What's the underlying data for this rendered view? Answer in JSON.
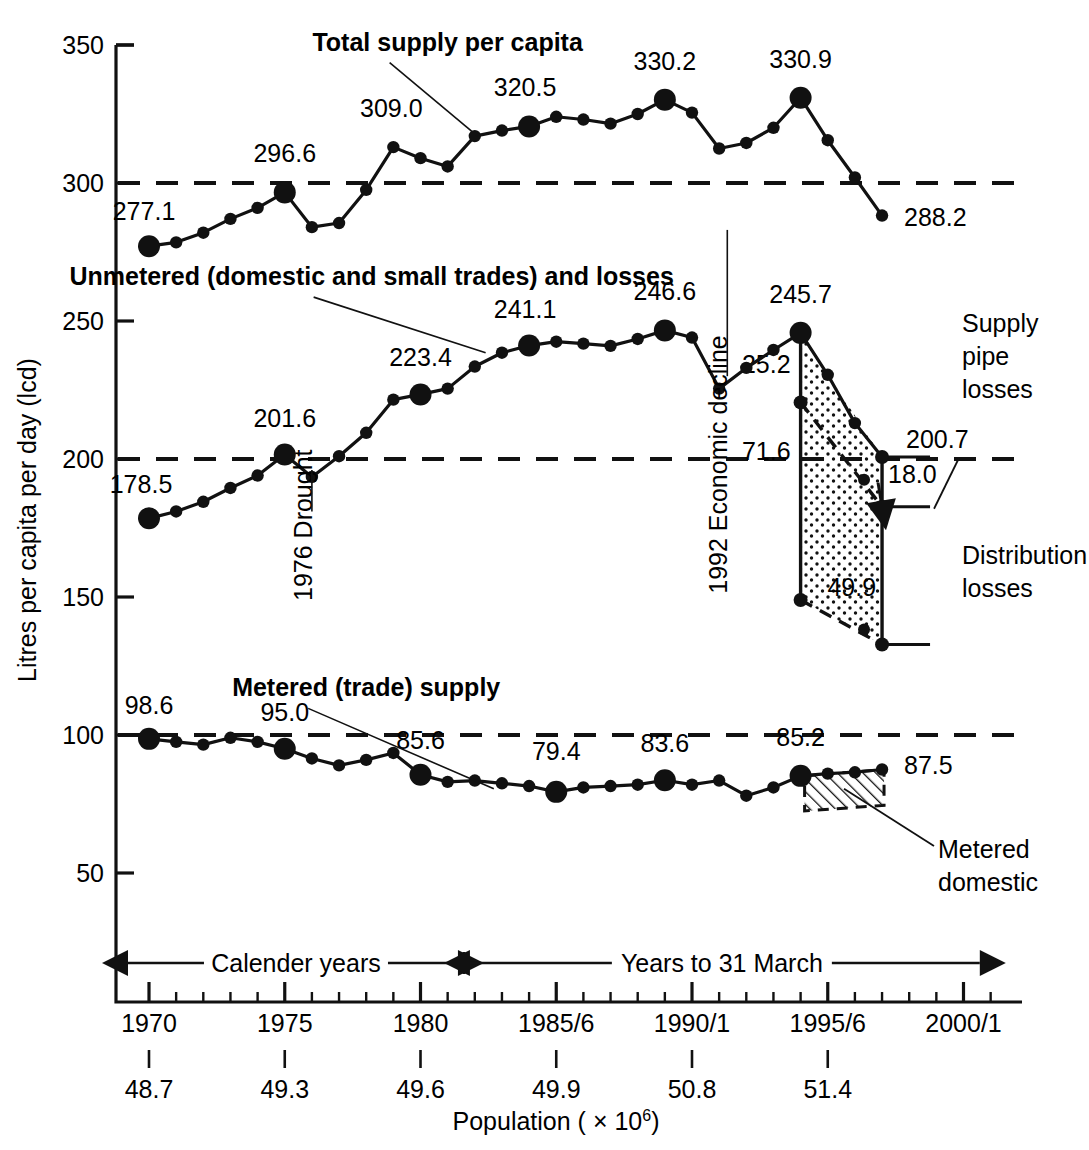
{
  "chart_data": {
    "type": "line",
    "title": "",
    "ylabel": "Litres per capita per day (lcd)",
    "xlabel": "Population ( × 10⁶)",
    "ylim": [
      25,
      350
    ],
    "yticks": [
      350,
      300,
      250,
      200,
      150,
      100,
      50
    ],
    "ytick_labels": [
      "350",
      "300",
      "250",
      "200",
      "150",
      "100",
      "50"
    ],
    "xlim": [
      1969.2,
      2001.5
    ],
    "xticks": [
      1970,
      1975,
      1980,
      1985,
      1990,
      1995,
      2000
    ],
    "xtick_labels": [
      "1970",
      "1975",
      "1980",
      "1985/6",
      "1990/1",
      "1995/6",
      "2000/1"
    ],
    "population_labels": [
      "48.7",
      "49.3",
      "49.6",
      "49.9",
      "50.8",
      "51.4"
    ],
    "population_years": [
      1970,
      1975,
      1980,
      1985,
      1990,
      1995
    ],
    "grid": false,
    "reference_lines": [
      300,
      200,
      100
    ],
    "legend_position": "inline-annotations",
    "series": [
      {
        "name": "Total supply per capita",
        "label_x": 1981.0,
        "label_y": 348,
        "leader_to_x": 1982.1,
        "leader_to_y": 317.0,
        "x": [
          1970,
          1971,
          1972,
          1973,
          1974,
          1975,
          1976,
          1977,
          1978,
          1979,
          1980,
          1981,
          1982,
          1983,
          1984,
          1985,
          1986,
          1987,
          1988,
          1989,
          1990,
          1991,
          1992,
          1993,
          1994,
          1995,
          1996,
          1997,
          1998
        ],
        "values": [
          277.1,
          278.5,
          282.0,
          287.0,
          291.0,
          296.6,
          284.0,
          285.5,
          297.5,
          313.0,
          309.0,
          306.0,
          317.0,
          319.0,
          320.5,
          324.0,
          323.0,
          321.5,
          325.0,
          330.2,
          325.5,
          312.5,
          314.5,
          320.0,
          330.9,
          315.5,
          302.0,
          288.2,
          null
        ],
        "marked_points": [
          {
            "x": 1970,
            "label": "277.1",
            "label_dx": -5,
            "label_dy": -26,
            "anchor": "middle"
          },
          {
            "x": 1975,
            "label": "296.6",
            "label_dx": 0,
            "label_dy": -30,
            "anchor": "middle"
          },
          {
            "x": 1979,
            "label": "309.0",
            "label_dx": -2,
            "label_dy": -30,
            "anchor": "middle",
            "plain_dot": true
          },
          {
            "x": 1980,
            "label": "",
            "label_dx": 0,
            "label_dy": 0,
            "anchor": "middle"
          },
          {
            "x": 1984,
            "label": "320.5",
            "label_dx": -4,
            "label_dy": -30,
            "anchor": "middle"
          },
          {
            "x": 1989,
            "label": "330.2",
            "label_dx": 0,
            "label_dy": -30,
            "anchor": "middle"
          },
          {
            "x": 1994,
            "label": "330.9",
            "label_dx": 0,
            "label_dy": -30,
            "anchor": "middle"
          },
          {
            "x": 1997,
            "label": "288.2",
            "label_dx": 22,
            "label_dy": 10,
            "anchor": "start",
            "plain_dot": true
          }
        ]
      },
      {
        "name": "Unmetered (domestic and small trades) and losses",
        "label_x": 1978.2,
        "label_y": 263,
        "leader_to_x": 1982.4,
        "leader_to_y": 238.5,
        "x": [
          1970,
          1971,
          1972,
          1973,
          1974,
          1975,
          1976,
          1977,
          1978,
          1979,
          1980,
          1981,
          1982,
          1983,
          1984,
          1985,
          1986,
          1987,
          1988,
          1989,
          1990,
          1991,
          1992,
          1993,
          1994,
          1995,
          1996,
          1997
        ],
        "values": [
          178.5,
          181.0,
          184.5,
          189.5,
          194.0,
          201.6,
          193.5,
          201.0,
          209.5,
          221.5,
          223.4,
          225.5,
          233.5,
          238.5,
          241.1,
          242.5,
          241.8,
          241.0,
          243.5,
          246.6,
          244.0,
          225.5,
          233.0,
          239.5,
          245.7,
          230.5,
          213.0,
          200.7
        ],
        "marked_points": [
          {
            "x": 1970,
            "label": "178.5",
            "label_dx": -8,
            "label_dy": -25,
            "anchor": "middle"
          },
          {
            "x": 1975,
            "label": "201.6",
            "label_dx": 0,
            "label_dy": -28,
            "anchor": "middle"
          },
          {
            "x": 1980,
            "label": "223.4",
            "label_dx": 0,
            "label_dy": -28,
            "anchor": "middle"
          },
          {
            "x": 1984,
            "label": "241.1",
            "label_dx": -4,
            "label_dy": -28,
            "anchor": "middle"
          },
          {
            "x": 1989,
            "label": "246.6",
            "label_dx": 0,
            "label_dy": -30,
            "anchor": "middle"
          },
          {
            "x": 1994,
            "label": "245.7",
            "label_dx": 0,
            "label_dy": -30,
            "anchor": "middle"
          },
          {
            "x": 1997,
            "label": "200.7",
            "label_dx": 24,
            "label_dy": -9,
            "anchor": "start",
            "plain_dot": true
          }
        ]
      },
      {
        "name": "Metered (trade) supply",
        "label_x": 1978.0,
        "label_y": 114,
        "leader_to_x": 1982.7,
        "leader_to_y": 80.5,
        "x": [
          1970,
          1971,
          1972,
          1973,
          1974,
          1975,
          1976,
          1977,
          1978,
          1979,
          1980,
          1981,
          1982,
          1983,
          1984,
          1985,
          1986,
          1987,
          1988,
          1989,
          1990,
          1991,
          1992,
          1993,
          1994,
          1995,
          1996,
          1997
        ],
        "values": [
          98.6,
          97.5,
          96.5,
          99.0,
          97.5,
          95.0,
          91.5,
          89.0,
          91.0,
          93.5,
          85.6,
          83.0,
          83.5,
          82.5,
          81.5,
          79.4,
          81.0,
          81.5,
          82.0,
          83.6,
          82.0,
          83.5,
          78.0,
          81.0,
          85.2,
          86.0,
          86.5,
          87.5
        ],
        "marked_points": [
          {
            "x": 1970,
            "label": "98.6",
            "label_dx": 0,
            "label_dy": -25,
            "anchor": "middle"
          },
          {
            "x": 1975,
            "label": "95.0",
            "label_dx": 0,
            "label_dy": -28,
            "anchor": "middle"
          },
          {
            "x": 1980,
            "label": "85.6",
            "label_dx": 0,
            "label_dy": -26,
            "anchor": "middle"
          },
          {
            "x": 1985,
            "label": "79.4",
            "label_dx": 0,
            "label_dy": -32,
            "anchor": "middle"
          },
          {
            "x": 1989,
            "label": "83.6",
            "label_dx": 0,
            "label_dy": -28,
            "anchor": "middle"
          },
          {
            "x": 1994,
            "label": "85.2",
            "label_dx": 0,
            "label_dy": -30,
            "anchor": "middle"
          },
          {
            "x": 1997,
            "label": "87.5",
            "label_dx": 22,
            "label_dy": 4,
            "anchor": "start",
            "plain_dot": true
          }
        ]
      }
    ],
    "annotations": [
      {
        "name": "drought",
        "text": "1976 Drought",
        "x": 1976.0,
        "y": 176,
        "rotated": true
      },
      {
        "name": "economic-decline",
        "text": "1992 Economic decline",
        "x": 1991.3,
        "y": 198,
        "rotated": true
      },
      {
        "name": "supply-pipe-losses",
        "text": "Supply pipe losses",
        "lines": [
          "Supply",
          "pipe",
          "losses"
        ]
      },
      {
        "name": "distribution-losses",
        "text": "Distribution losses",
        "lines": [
          "Distribution",
          "losses"
        ]
      },
      {
        "name": "metered-domestic",
        "text": "Metered domestic",
        "lines": [
          "Metered",
          "domestic"
        ]
      }
    ],
    "loss_breakdown": {
      "supply_pipe_losses_1995": "25.2",
      "distribution_losses_1995": "71.6",
      "supply_pipe_losses_1998": "18.0",
      "distribution_losses_1998": "49.9",
      "unmetered_1995": "245.7",
      "unmetered_1998": "200.7"
    },
    "axis_ranges": {
      "calendar_years_label": "Calender years",
      "financial_years_label": "Years to 31 March",
      "split_year": 1981.6
    }
  }
}
